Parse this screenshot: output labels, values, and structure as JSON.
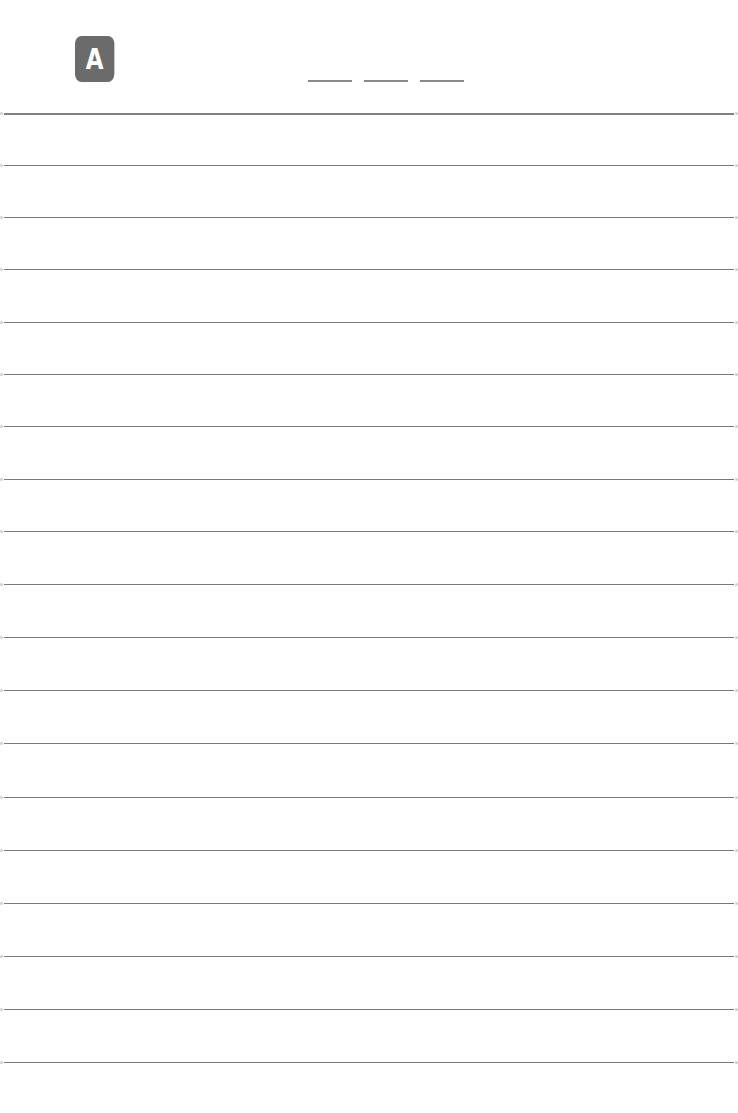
{
  "badge": {
    "letter": "A",
    "color": "#6b6b6b"
  },
  "date_field": {
    "blanks": 3
  },
  "ruled_lines": {
    "count": 19,
    "color": "#7a7a7a",
    "positions_y": [
      113,
      165,
      217,
      269,
      322,
      374,
      426,
      479,
      531,
      584,
      637,
      690,
      743,
      797,
      850,
      903,
      956,
      1009,
      1062
    ]
  }
}
